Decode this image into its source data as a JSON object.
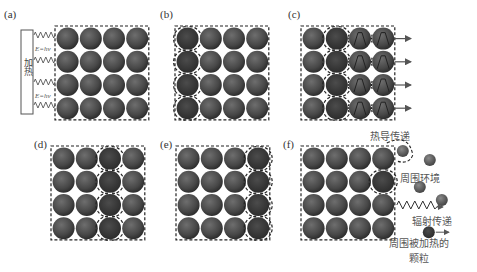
{
  "figure": {
    "panels": [
      {
        "id": "a",
        "label": "(a)",
        "grid": {
          "x": 56,
          "y": 27,
          "rows": 4,
          "cols": 4,
          "pitch": 23.2,
          "r": 11
        },
        "heater_label": "加热",
        "energy_label": "E=hν"
      },
      {
        "id": "b",
        "label": "(b)",
        "grid": {
          "x": 176,
          "y": 27,
          "rows": 4,
          "cols": 4,
          "pitch": 23.2,
          "r": 11
        }
      },
      {
        "id": "c",
        "label": "(c)",
        "grid": {
          "x": 302,
          "y": 27,
          "rows": 4,
          "cols": 4,
          "pitch": 23.2,
          "r": 11
        }
      },
      {
        "id": "d",
        "label": "(d)",
        "grid": {
          "x": 52,
          "y": 147,
          "rows": 4,
          "cols": 4,
          "pitch": 23.2,
          "r": 11
        }
      },
      {
        "id": "e",
        "label": "(e)",
        "grid": {
          "x": 177,
          "y": 147,
          "rows": 4,
          "cols": 4,
          "pitch": 23.2,
          "r": 11
        }
      },
      {
        "id": "f",
        "label": "(f)",
        "grid": {
          "x": 302,
          "y": 147,
          "rows": 4,
          "cols": 4,
          "pitch": 23.2,
          "r": 11
        }
      }
    ],
    "annotations": {
      "heat_conduction": "热导传递",
      "environment": "周围环境",
      "radiation": "辐射传递",
      "heated_particles_line1": "周围被加热的",
      "heated_particles_line2": "颗粒"
    },
    "colors": {
      "particle": "#4a4a4a",
      "particle_highlight": "#6a6a6a",
      "particle_hot": "#3a3a3a",
      "dash": "#222222",
      "text": "#555555"
    }
  }
}
